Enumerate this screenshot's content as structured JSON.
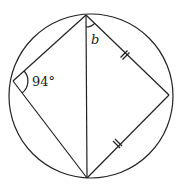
{
  "diagram": {
    "type": "cyclic-quadrilateral",
    "circle": {
      "cx": 91,
      "cy": 96,
      "r": 82
    },
    "vertices": {
      "top": {
        "x": 86,
        "y": 15
      },
      "left": {
        "x": 13,
        "y": 81
      },
      "right": {
        "x": 169,
        "y": 95
      },
      "bottom": {
        "x": 87,
        "y": 178
      }
    },
    "diagonal": "top-bottom",
    "equal_sides": [
      "top-right",
      "right-bottom"
    ],
    "tick_marks_per_equal_side": 2,
    "labels": {
      "angle_left": "94°",
      "angle_top": "b"
    },
    "stroke_color": "#222222",
    "background_color": "#ffffff"
  }
}
